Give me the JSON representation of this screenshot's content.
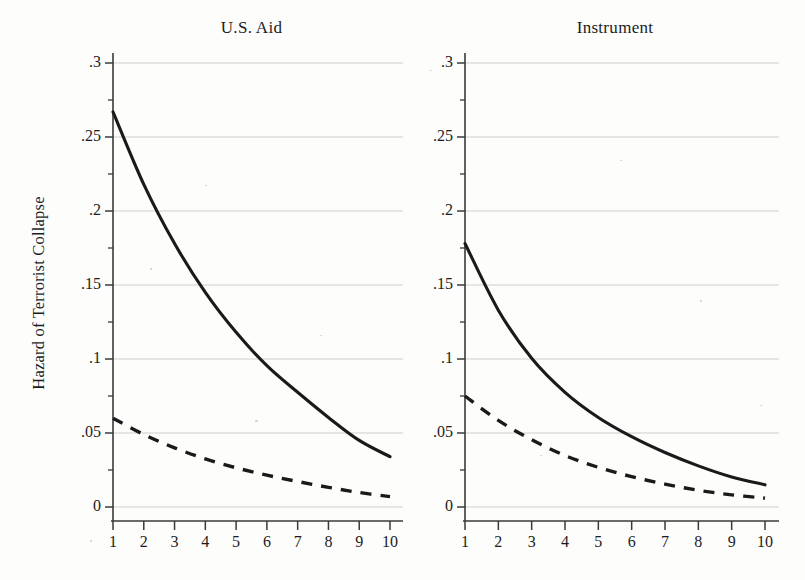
{
  "figure": {
    "ylabel": "Hazard of Terrorist Collapse"
  },
  "panels": [
    {
      "title": "U.S. Aid"
    },
    {
      "title": "Instrument"
    }
  ],
  "axis": {
    "y_ticks": [
      "0",
      ".05",
      ".1",
      ".15",
      ".2",
      ".25",
      ".3"
    ],
    "x_ticks": [
      "1",
      "2",
      "3",
      "4",
      "5",
      "6",
      "7",
      "8",
      "9",
      "10"
    ]
  },
  "chart_data": [
    {
      "type": "line",
      "title": "U.S. Aid",
      "xlabel": "",
      "ylabel": "Hazard of Terrorist Collapse",
      "xlim": [
        1,
        10
      ],
      "ylim": [
        0,
        0.3
      ],
      "grid": true,
      "legend": "none",
      "x": [
        1,
        2,
        3,
        4,
        5,
        6,
        7,
        8,
        9,
        10
      ],
      "series": [
        {
          "name": "solid",
          "style": "solid",
          "values": [
            0.267,
            0.218,
            0.178,
            0.145,
            0.118,
            0.0955,
            0.0775,
            0.0605,
            0.045,
            0.034
          ]
        },
        {
          "name": "dashed",
          "style": "dashed",
          "values": [
            0.06,
            0.049,
            0.04,
            0.0325,
            0.0265,
            0.0215,
            0.0172,
            0.0133,
            0.0098,
            0.007
          ]
        }
      ]
    },
    {
      "type": "line",
      "title": "Instrument",
      "xlabel": "",
      "ylabel": "Hazard of Terrorist Collapse",
      "xlim": [
        1,
        10
      ],
      "ylim": [
        0,
        0.3
      ],
      "grid": true,
      "legend": "none",
      "x": [
        1,
        2,
        3,
        4,
        5,
        6,
        7,
        8,
        9,
        10
      ],
      "series": [
        {
          "name": "solid",
          "style": "solid",
          "values": [
            0.178,
            0.133,
            0.1005,
            0.0775,
            0.0605,
            0.0475,
            0.0368,
            0.0278,
            0.0203,
            0.015
          ]
        },
        {
          "name": "dashed",
          "style": "dashed",
          "values": [
            0.075,
            0.0585,
            0.0455,
            0.0348,
            0.0268,
            0.0205,
            0.0155,
            0.0113,
            0.0082,
            0.006
          ]
        }
      ]
    }
  ]
}
